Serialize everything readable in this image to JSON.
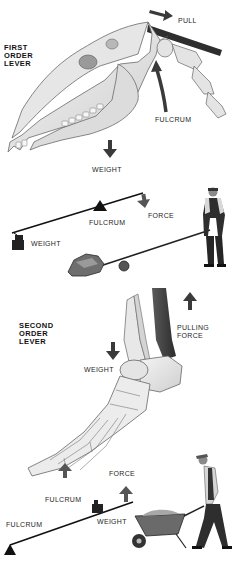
{
  "first_order": {
    "heading": [
      "FIRST",
      "ORDER",
      "LEVER"
    ],
    "skull_labels": {
      "pull": "PULL",
      "fulcrum": "FULCRUM",
      "weight": "WEIGHT"
    },
    "seesaw_labels": {
      "fulcrum": "FULCRUM",
      "force": "FORCE",
      "weight": "WEIGHT"
    }
  },
  "second_order": {
    "heading": [
      "SECOND",
      "ORDER",
      "LEVER"
    ],
    "foot_labels": {
      "pulling_force": [
        "PULLING",
        "FORCE"
      ],
      "weight": "WEIGHT",
      "fulcrum": "FULCRUM"
    },
    "lever_labels": {
      "force": "FORCE",
      "fulcrum": "FULCRUM",
      "weight": "WEIGHT"
    }
  },
  "colors": {
    "arrow": "#4a4a4a",
    "bone_fill": "#ececec",
    "bone_stroke": "#6a6a6a",
    "ink": "#111111"
  }
}
